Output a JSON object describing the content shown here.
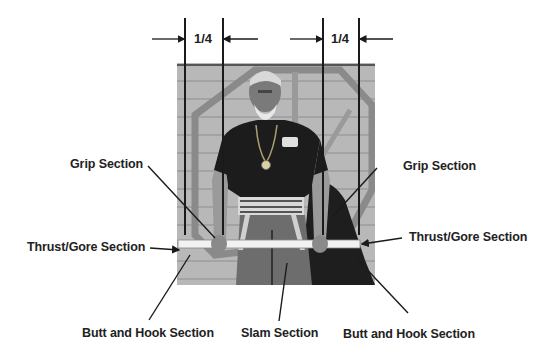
{
  "diagram": {
    "type": "annotated-photo",
    "measurements": [
      {
        "label": "1/4",
        "position": "left"
      },
      {
        "label": "1/4",
        "position": "right"
      }
    ],
    "labels": {
      "grip_left": "Grip Section",
      "grip_right": "Grip Section",
      "thrust_left": "Thrust/Gore Section",
      "thrust_right": "Thrust/Gore Section",
      "butt_hook_left": "Butt and Hook Section",
      "slam": "Slam Section",
      "butt_hook_right": "Butt and Hook Section"
    },
    "colors": {
      "line": "#1a1a1a",
      "photo_bg": "#b9b9b9",
      "staff": "#f2f2f2",
      "shirt": "#1c1c1c"
    }
  }
}
